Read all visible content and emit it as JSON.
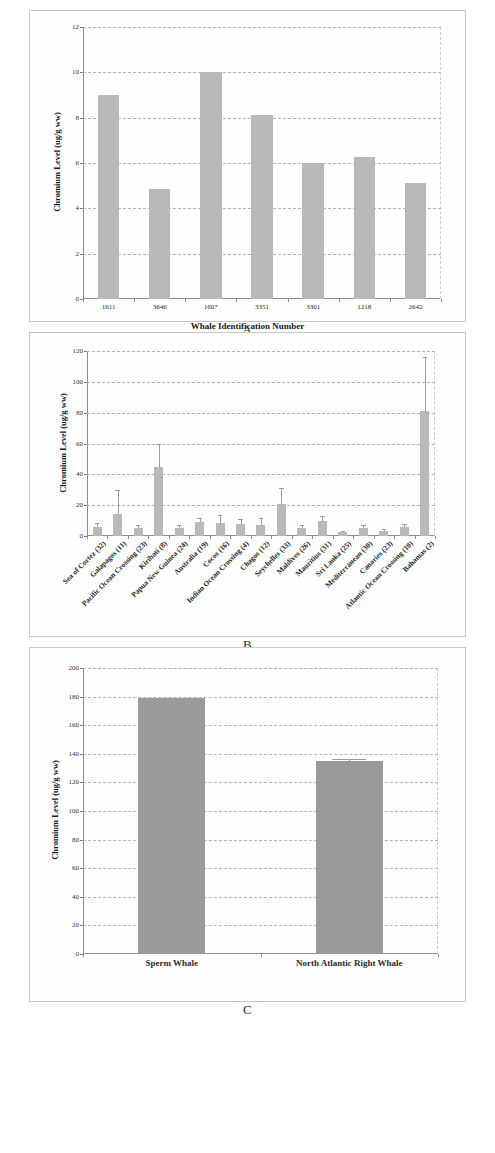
{
  "figure": {
    "panel_letters": [
      "A",
      "B",
      "C"
    ]
  },
  "chart_data": [
    {
      "type": "bar",
      "panel": "A",
      "title": "",
      "xlabel": "Whale Identification Number",
      "ylabel": "Chromium Level (ug/g ww)",
      "categories": [
        "1611",
        "3646",
        "1607",
        "3351",
        "3301",
        "1218",
        "2642"
      ],
      "values": [
        9.0,
        4.85,
        10.0,
        8.1,
        6.0,
        6.25,
        5.1
      ],
      "ylim": [
        0,
        12
      ],
      "yticks": [
        0,
        2,
        4,
        6,
        8,
        10,
        12
      ],
      "grid": true,
      "legend": "none",
      "bar_color": "#b9b9b9"
    },
    {
      "type": "bar",
      "panel": "B",
      "title": "",
      "xlabel": "",
      "ylabel": "Chromium Level (ug/g ww)",
      "categories": [
        "Sea of Cortez (32)",
        "Galapagos (11)",
        "Pacific Ocean Crossing (23)",
        "Kiribati (8)",
        "Papua New Guinea (24)",
        "Australia (19)",
        "Cocos (16)",
        "Indian Ocean Crossing (4)",
        "Chagos (12)",
        "Seychelles (33)",
        "Maldives (26)",
        "Mauritius (31)",
        "Sri Lanka (25)",
        "Mediterranean (30)",
        "Canaries (23)",
        "Atlantic Ocean Crossing (10)",
        "Bahamas (2)"
      ],
      "values": [
        6.0,
        14.5,
        5.5,
        44.5,
        5.5,
        9.0,
        8.5,
        7.5,
        7.0,
        20.5,
        5.0,
        9.5,
        2.5,
        5.0,
        3.0,
        6.0,
        81.0
      ],
      "errors_upper": [
        8.5,
        30.0,
        7.0,
        59.5,
        7.0,
        12.0,
        13.5,
        11.0,
        11.5,
        31.0,
        7.0,
        13.0,
        3.5,
        7.0,
        4.5,
        8.0,
        116.0
      ],
      "ylim": [
        0,
        120
      ],
      "yticks": [
        0,
        20,
        40,
        60,
        80,
        100,
        120
      ],
      "grid": true,
      "legend": "none",
      "bar_color": "#b9b9b9"
    },
    {
      "type": "bar",
      "panel": "C",
      "title": "",
      "xlabel": "",
      "ylabel": "Chromium Level (ug/g ww)",
      "categories": [
        "Sperm Whale",
        "North Atlantic Right Whale"
      ],
      "values": [
        179.0,
        135.0
      ],
      "errors_upper": [
        179.0,
        136.5
      ],
      "ylim": [
        0,
        200
      ],
      "yticks": [
        0,
        20,
        40,
        60,
        80,
        100,
        120,
        140,
        160,
        180,
        200
      ],
      "grid": true,
      "legend": "none",
      "bar_color": "#9a9a9a"
    }
  ]
}
